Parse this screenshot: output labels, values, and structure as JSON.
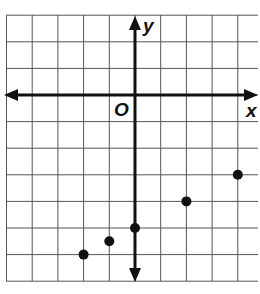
{
  "chart_data": {
    "type": "scatter",
    "title": "",
    "xlabel": "x",
    "ylabel": "y",
    "origin_label": "O",
    "grid": true,
    "xlim": [
      -5,
      5
    ],
    "ylim": [
      -7,
      3
    ],
    "points": [
      {
        "x": -2,
        "y": -6
      },
      {
        "x": -1,
        "y": -5.5
      },
      {
        "x": 0,
        "y": -5
      },
      {
        "x": 2,
        "y": -4
      },
      {
        "x": 4,
        "y": -3
      }
    ]
  },
  "labels": {
    "x_axis": "x",
    "y_axis": "y",
    "origin": "O"
  },
  "colors": {
    "grid": "#555555",
    "axis": "#111111",
    "point": "#111111"
  }
}
